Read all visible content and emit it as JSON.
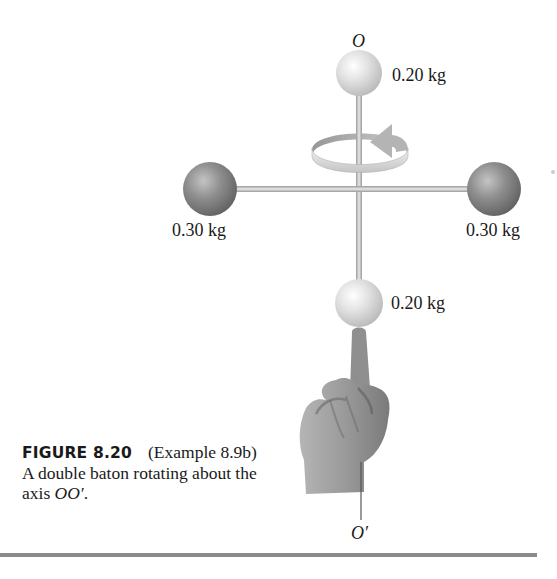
{
  "figure": {
    "axis_top_label": "O",
    "axis_bottom_label": "O′",
    "masses": {
      "top": "0.20 kg",
      "left": "0.30 kg",
      "right": "0.30 kg",
      "bottom": "0.20 kg"
    },
    "rotation_arrow": "counterclockwise-rotation-arrow",
    "hand": "pointing-finger-hand"
  },
  "caption": {
    "figure_number": "FIGURE 8.20",
    "text_prefix": "(Example 8.9b) A double baton rotating about the axis ",
    "axis_ref": "OO′",
    "text_suffix": "."
  },
  "colors": {
    "light_sphere": "#d9d9d9",
    "dark_sphere": "#8c8c8c",
    "rod": "#c8c8c8",
    "hand": "#9a9a9a",
    "divider": "#8a8a8a"
  }
}
